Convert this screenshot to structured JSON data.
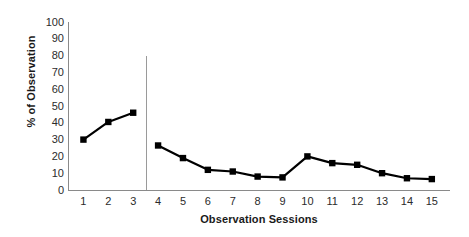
{
  "chart_data": {
    "type": "line",
    "title": "",
    "xlabel": "Observation Sessions",
    "ylabel": "% of Observation",
    "categories": [
      "1",
      "2",
      "3",
      "4",
      "5",
      "6",
      "7",
      "8",
      "9",
      "10",
      "11",
      "12",
      "13",
      "14",
      "15"
    ],
    "values": [
      30,
      40.5,
      46,
      26.5,
      19,
      12,
      11,
      8,
      7.5,
      20,
      16,
      15,
      10,
      7,
      6.5
    ],
    "series": [
      {
        "name": "% of Observation",
        "values": [
          30,
          40.5,
          46,
          26.5,
          19,
          12,
          11,
          8,
          7.5,
          20,
          16,
          15,
          10,
          7,
          6.5
        ]
      }
    ],
    "ylim": [
      0,
      100
    ],
    "ytick_labels": [
      "100",
      "90",
      "80",
      "70",
      "60",
      "50",
      "40",
      "30",
      "20",
      "10",
      "0"
    ],
    "ytick_values": [
      100,
      90,
      80,
      70,
      60,
      50,
      40,
      30,
      20,
      10,
      0
    ],
    "xtick_labels": [
      "1",
      "2",
      "3",
      "4",
      "5",
      "6",
      "7",
      "8",
      "9",
      "10",
      "11",
      "12",
      "13",
      "14",
      "15"
    ],
    "grid": false,
    "legend": null,
    "marker": "square",
    "marker_color": "#000000",
    "line_color": "#000000",
    "axis_color": "#8a8a8a",
    "background_color": "#ffffff",
    "annotations": [
      {
        "name": "phase-divider",
        "type": "vertical-line",
        "x_between": [
          3,
          4
        ],
        "color": "#9a9a9a"
      }
    ]
  }
}
